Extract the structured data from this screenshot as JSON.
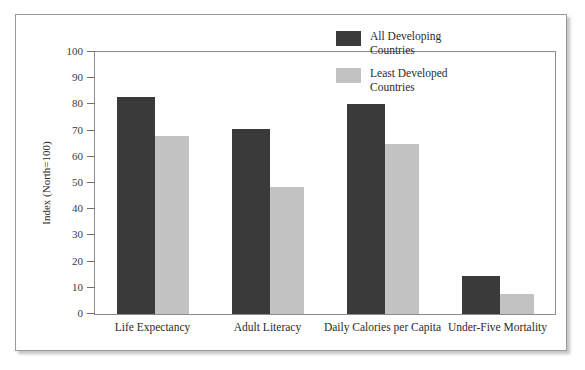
{
  "chart_data": {
    "type": "bar",
    "title": "",
    "xlabel": "",
    "ylabel": "Index (North=100)",
    "ylim": [
      0,
      100
    ],
    "ytick_step": 10,
    "yticks": [
      100,
      90,
      80,
      70,
      60,
      50,
      40,
      30,
      20,
      10,
      0
    ],
    "grid": false,
    "legend_position": "top-right",
    "categories": [
      "Life Expectancy",
      "Adult Literacy",
      "Daily Calories per Capita",
      "Under-Five Mortality"
    ],
    "series": [
      {
        "name": "All Developing Countries",
        "color": "#3a3a3a",
        "values": [
          83,
          70.5,
          80,
          14.5
        ]
      },
      {
        "name": "Least Developed Countries",
        "color": "#c2c2c2",
        "values": [
          68,
          48.5,
          65,
          7.5
        ]
      }
    ]
  },
  "legend": {
    "entries": [
      {
        "label": "All Developing\nCountries",
        "color": "#3a3a3a"
      },
      {
        "label": "Least Developed\nCountries",
        "color": "#c2c2c2"
      }
    ]
  },
  "colors": {
    "series_dark": "#3a3a3a",
    "series_light": "#c2c2c2",
    "frame": "#9a9a9a",
    "axis": "#8d8d8d",
    "background": "#ffffff"
  }
}
